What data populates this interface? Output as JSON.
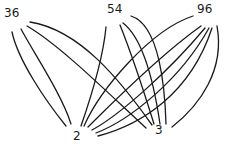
{
  "diagram": {
    "type": "bipartite-graph",
    "top_nodes": [
      {
        "id": "n36",
        "label": "36",
        "x": 10,
        "y": 14
      },
      {
        "id": "n54",
        "label": "54",
        "x": 107,
        "y": 10
      },
      {
        "id": "n96",
        "label": "96",
        "x": 200,
        "y": 10
      }
    ],
    "bottom_nodes": [
      {
        "id": "n2",
        "label": "2",
        "x": 74,
        "y": 134
      },
      {
        "id": "n3",
        "label": "3",
        "x": 157,
        "y": 128
      }
    ],
    "edges": [
      {
        "from": "36",
        "to": "2",
        "d": "M12,32 C18,60 45,100 66,126"
      },
      {
        "from": "36",
        "to": "2",
        "d": "M21,29 C35,55 62,95 71,124"
      },
      {
        "from": "36",
        "to": "3",
        "d": "M30,22 C80,30 120,80 152,125"
      },
      {
        "from": "36",
        "to": "3",
        "d": "M27,26 C60,45 110,95 146,128"
      },
      {
        "from": "54",
        "to": "2",
        "d": "M106,27 C103,60 90,100 81,126"
      },
      {
        "from": "54",
        "to": "3",
        "d": "M120,25 C130,50 145,95 154,124"
      },
      {
        "from": "54",
        "to": "3",
        "d": "M123,23 C145,40 155,90 160,124"
      },
      {
        "from": "54",
        "to": "3",
        "d": "M131,16 C160,25 165,90 166,124"
      },
      {
        "from": "96",
        "to": "2",
        "d": "M193,16 C150,30 100,90 84,126"
      },
      {
        "from": "96",
        "to": "2",
        "d": "M201,26 C160,55 110,105 88,127"
      },
      {
        "from": "96",
        "to": "2",
        "d": "M205,28 C170,70 120,115 92,130"
      },
      {
        "from": "96",
        "to": "2",
        "d": "M209,28 C180,80 130,120 96,133"
      },
      {
        "from": "96",
        "to": "2",
        "d": "M212,28 C190,95 140,125 98,136"
      },
      {
        "from": "96",
        "to": "3",
        "d": "M217,26 C225,70 200,105 172,127"
      }
    ]
  }
}
